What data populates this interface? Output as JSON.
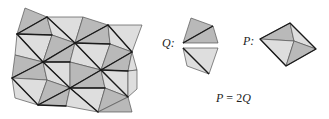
{
  "figure": {
    "labels": {
      "q_label": "Q:",
      "p_label": "P:",
      "equation": {
        "lhs": "P",
        "op": "=",
        "coef": "2",
        "rhs": "Q"
      }
    },
    "colors": {
      "dark_fill": "#b9b9b9",
      "light_fill": "#dedede",
      "thin_stroke": "#555555",
      "bold_stroke": "#1a1a1a",
      "background": "#ffffff"
    }
  }
}
